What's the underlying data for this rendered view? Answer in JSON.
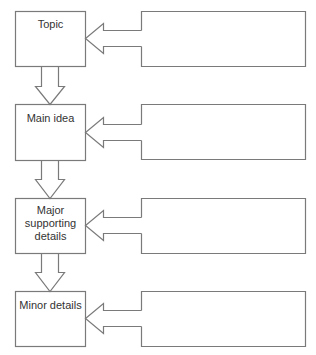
{
  "diagram": {
    "type": "hierarchy-flow",
    "stroke_color": "#7a7a7a",
    "text_color": "#333333",
    "rows": [
      {
        "label": "Topic",
        "lines": [
          "Topic"
        ],
        "right_box_text": ""
      },
      {
        "label": "Main idea",
        "lines": [
          "Main idea"
        ],
        "right_box_text": ""
      },
      {
        "label": "Major supporting details",
        "lines": [
          "Major",
          "supporting",
          "details"
        ],
        "right_box_text": ""
      },
      {
        "label": "Minor details",
        "lines": [
          "Minor details"
        ],
        "right_box_text": ""
      }
    ],
    "connections": [
      {
        "from": "Topic",
        "to": "Main idea",
        "direction": "down"
      },
      {
        "from": "Main idea",
        "to": "Major supporting details",
        "direction": "down"
      },
      {
        "from": "Major supporting details",
        "to": "Minor details",
        "direction": "down"
      }
    ]
  }
}
